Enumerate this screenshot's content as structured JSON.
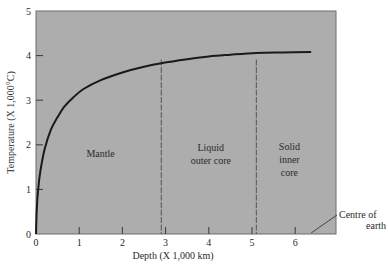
{
  "chart_data": {
    "type": "line",
    "title": "",
    "xlabel": "Depth (X 1,000 km)",
    "ylabel": "Temperature (X 1,000°C)",
    "xlim": [
      0,
      7
    ],
    "ylim": [
      0,
      5
    ],
    "xticks": [
      "0",
      "1",
      "2",
      "3",
      "4",
      "5",
      "6"
    ],
    "yticks": [
      "0",
      "1",
      "2",
      "3",
      "4",
      "5"
    ],
    "grid": false,
    "legend": null,
    "series": [
      {
        "name": "Temperature profile",
        "x": [
          0,
          0.02,
          0.05,
          0.1,
          0.2,
          0.35,
          0.5,
          0.65,
          0.85,
          1.1,
          1.5,
          2.0,
          2.5,
          2.9,
          3.5,
          4.0,
          4.5,
          5.1,
          5.7,
          6.37
        ],
        "y": [
          0,
          0.6,
          1.0,
          1.4,
          1.9,
          2.35,
          2.62,
          2.85,
          3.05,
          3.25,
          3.45,
          3.62,
          3.75,
          3.83,
          3.92,
          3.98,
          4.02,
          4.06,
          4.07,
          4.08
        ]
      }
    ],
    "boundaries": [
      {
        "x": 2.9,
        "style": "dashed"
      },
      {
        "x": 5.1,
        "style": "dashed"
      }
    ],
    "regions": [
      {
        "label": [
          "Mantle"
        ],
        "x_center": 1.45
      },
      {
        "label": [
          "Liquid",
          "outer core"
        ],
        "x_center": 4.0
      },
      {
        "label": [
          "Solid",
          "inner",
          "core"
        ],
        "x_center": 5.75
      }
    ],
    "annotations": [
      {
        "text": [
          "Centre of",
          "earth"
        ],
        "points_to_x": 6.37
      }
    ],
    "plot_background": "#adadad",
    "line_color": "#1a1a1a"
  }
}
